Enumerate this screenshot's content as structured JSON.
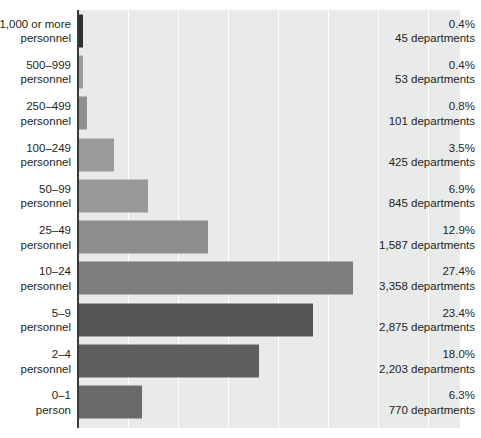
{
  "chart_data": {
    "type": "bar",
    "orientation": "horizontal",
    "title": "",
    "subtitle": "",
    "xlabel": "",
    "ylabel": "",
    "xlim": [
      0,
      38.2
    ],
    "grid": "vertical",
    "gridline_interval_percent": 5,
    "legend": "none",
    "categories": [
      "1,000 or more\npersonnel",
      "500–999\npersonnel",
      "250–499\npersonnel",
      "100–249\npersonnel",
      "50–99\npersonnel",
      "25–49\npersonnel",
      "10–24\npersonnel",
      "5–9\npersonnel",
      "2–4\npersonnel",
      "0–1\nperson"
    ],
    "values": [
      0.4,
      0.4,
      0.8,
      3.5,
      6.9,
      12.9,
      27.4,
      23.4,
      18.0,
      6.3
    ],
    "counts": [
      45,
      53,
      101,
      425,
      845,
      1587,
      3358,
      2875,
      2203,
      770
    ],
    "value_labels": [
      "0.4%\n45 departments",
      "0.4%\n53 departments",
      "0.8%\n101 departments",
      "3.5%\n425 departments",
      "6.9%\n845 departments",
      "12.9%\n1,587 departments",
      "27.4%\n3,358 departments",
      "23.4%\n2,875 departments",
      "18.0%\n2,203 departments",
      "6.3%\n770 departments"
    ],
    "bar_colors": [
      "#2f2f2f",
      "#9b9b9b",
      "#8f8f8f",
      "#9a9a9a",
      "#989898",
      "#8e8e8e",
      "#7d7d7d",
      "#565656",
      "#5f5f5f",
      "#6a6a6a"
    ],
    "plot_background": "#e9eaea",
    "gridline_color": "#ffffff",
    "axis_color": "#3a3a3a"
  },
  "rows": [
    {
      "category": "1,000 or more\npersonnel",
      "percent": "0.4%",
      "count": "45 departments",
      "value_label": "0.4%\n45 departments",
      "value": 0.4,
      "color": "#2f2f2f"
    },
    {
      "category": "500–999\npersonnel",
      "percent": "0.4%",
      "count": "53 departments",
      "value_label": "0.4%\n53 departments",
      "value": 0.4,
      "color": "#9b9b9b"
    },
    {
      "category": "250–499\npersonnel",
      "percent": "0.8%",
      "count": "101 departments",
      "value_label": "0.8%\n101 departments",
      "value": 0.8,
      "color": "#8f8f8f"
    },
    {
      "category": "100–249\npersonnel",
      "percent": "3.5%",
      "count": "425 departments",
      "value_label": "3.5%\n425 departments",
      "value": 3.5,
      "color": "#9a9a9a"
    },
    {
      "category": "50–99\npersonnel",
      "percent": "6.9%",
      "count": "845 departments",
      "value_label": "6.9%\n845 departments",
      "value": 6.9,
      "color": "#989898"
    },
    {
      "category": "25–49\npersonnel",
      "percent": "12.9%",
      "count": "1,587 departments",
      "value_label": "12.9%\n1,587 departments",
      "value": 12.9,
      "color": "#8e8e8e"
    },
    {
      "category": "10–24\npersonnel",
      "percent": "27.4%",
      "count": "3,358 departments",
      "value_label": "27.4%\n3,358 departments",
      "value": 27.4,
      "color": "#7d7d7d"
    },
    {
      "category": "5–9\npersonnel",
      "percent": "23.4%",
      "count": "2,875 departments",
      "value_label": "23.4%\n2,875 departments",
      "value": 23.4,
      "color": "#565656"
    },
    {
      "category": "2–4\npersonnel",
      "percent": "18.0%",
      "count": "2,203 departments",
      "value_label": "18.0%\n2,203 departments",
      "value": 18.0,
      "color": "#5f5f5f"
    },
    {
      "category": "0–1\nperson",
      "percent": "6.3%",
      "count": "770 departments",
      "value_label": "6.3%\n770 departments",
      "value": 6.3,
      "color": "#6a6a6a"
    }
  ]
}
